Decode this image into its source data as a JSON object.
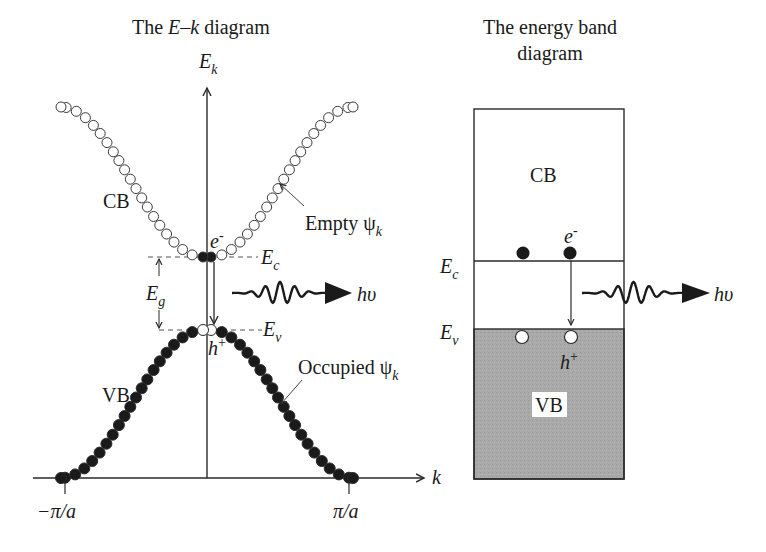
{
  "left_diagram": {
    "title_prefix": "The ",
    "title_italic": "E–k",
    "title_suffix": " diagram",
    "y_axis": {
      "symbol": "E",
      "subscript": "k"
    },
    "x_axis": {
      "symbol": "k"
    },
    "x_ticks": [
      "−π/a",
      "π/a"
    ],
    "cb_label": "CB",
    "vb_label": "VB",
    "empty_label": "Empty ψ",
    "empty_sub": "k",
    "occupied_label": "Occupied ψ",
    "occupied_sub": "k",
    "electron": {
      "symbol": "e",
      "sup": "-"
    },
    "hole": {
      "symbol": "h",
      "sup": "+"
    },
    "ec": {
      "symbol": "E",
      "sub": "c"
    },
    "ev": {
      "symbol": "E",
      "sub": "v"
    },
    "eg": {
      "symbol": "E",
      "sub": "g"
    },
    "photon": "hυ"
  },
  "right_diagram": {
    "title_line1": "The energy band",
    "title_line2": "diagram",
    "cb_label": "CB",
    "vb_label": "VB",
    "electron": {
      "symbol": "e",
      "sup": "-"
    },
    "hole": {
      "symbol": "h",
      "sup": "+"
    },
    "ec": {
      "symbol": "E",
      "sub": "c"
    },
    "ev": {
      "symbol": "E",
      "sub": "v"
    },
    "photon": "hυ"
  },
  "colors": {
    "line": "#2a2a2a",
    "dot_filled": "#1a1a1a",
    "vb_fill": "#a8a8a8",
    "background": "#ffffff"
  }
}
